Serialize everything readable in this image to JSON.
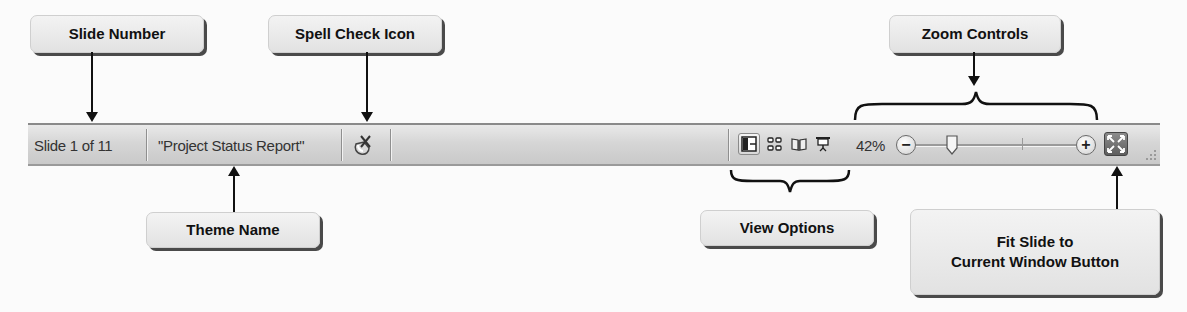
{
  "callouts": {
    "slide_number": "Slide Number",
    "spell_check": "Spell Check Icon",
    "zoom_controls": "Zoom Controls",
    "theme_name": "Theme Name",
    "view_options": "View Options",
    "fit_slide_line1": "Fit Slide to",
    "fit_slide_line2": "Current Window Button"
  },
  "statusbar": {
    "slide_indicator": "Slide 1 of 11",
    "theme_name": "\"Project Status Report\"",
    "spell_check_icon": "spell-check-icon",
    "view_buttons": [
      {
        "name": "normal-view",
        "icon": "normal-view-icon",
        "active": true
      },
      {
        "name": "slide-sorter-view",
        "icon": "slide-sorter-icon",
        "active": false
      },
      {
        "name": "reading-view",
        "icon": "reading-view-icon",
        "active": false
      },
      {
        "name": "slide-show-view",
        "icon": "slide-show-icon",
        "active": false
      }
    ],
    "zoom_level": "42%",
    "zoom_out_label": "−",
    "zoom_in_label": "+",
    "fit_button_icon": "fit-to-window-icon"
  },
  "colors": {
    "statusbar_top": "#e9e9e9",
    "statusbar_bottom": "#c9c9c9",
    "callout_bg": "#ececec",
    "callout_shadow": "#4a4a4a",
    "arrow": "#111111"
  }
}
